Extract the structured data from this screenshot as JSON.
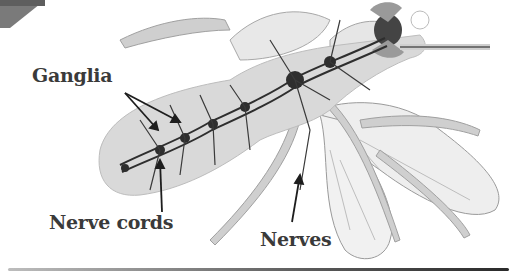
{
  "diagram": {
    "labels": {
      "ganglia": "Ganglia",
      "nerve_cords": "Nerve cords",
      "nerves": "Nerves"
    },
    "colors": {
      "body_fill": "#d9d9d9",
      "wing_fill": "#efefef",
      "nerve_stroke": "#2e2e2e",
      "label_text": "#3a3a3a",
      "corner_tab": "#7a7a7a"
    }
  }
}
